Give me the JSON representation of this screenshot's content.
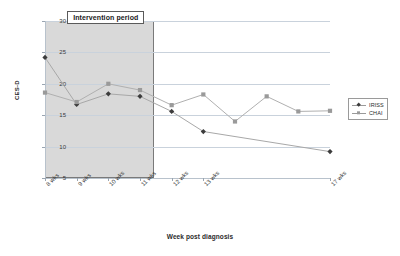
{
  "chart_data": {
    "type": "line",
    "title": "",
    "xlabel": "Week post diagnosis",
    "ylabel": "CES-D",
    "ylim": [
      5,
      30
    ],
    "yticks": [
      5,
      10,
      15,
      20,
      25,
      30
    ],
    "grid": true,
    "legend_position": "right",
    "categories": [
      "8 wks",
      "9 wks",
      "10 wks",
      "11 wks",
      "12 wks",
      "13 wks",
      "17 wks"
    ],
    "x_positions": [
      0,
      1,
      2,
      3,
      4,
      5,
      9
    ],
    "xlim": [
      0,
      9
    ],
    "annotations": [
      {
        "text": "Intervention period",
        "type": "shaded-band",
        "x_start": 0,
        "x_end": 3.45
      }
    ],
    "series": [
      {
        "name": "IRISS",
        "marker": "diamond",
        "color": "#3c3c3c",
        "line_color": "#a8a8a8",
        "x": [
          0,
          1,
          2,
          3,
          4,
          5,
          9
        ],
        "values": [
          24.2,
          16.7,
          18.4,
          18.0,
          15.6,
          12.4,
          9.2
        ]
      },
      {
        "name": "CHAI",
        "marker": "square",
        "color": "#9a9a9a",
        "line_color": "#b0b0b0",
        "x": [
          0,
          1,
          2,
          3,
          4,
          5,
          6,
          7,
          8,
          9
        ],
        "values": [
          18.6,
          17.1,
          20.0,
          19.0,
          16.6,
          18.3,
          14.0,
          18.0,
          15.6,
          15.7
        ]
      }
    ]
  },
  "legend": {
    "items": [
      {
        "label": "IRISS"
      },
      {
        "label": "CHAI"
      }
    ]
  },
  "axes": {
    "y_title": "CES-D",
    "x_title": "Week post diagnosis",
    "y_tick_labels": [
      "30",
      "25",
      "20",
      "15",
      "10",
      "5"
    ],
    "x_tick_labels": [
      "8 wks",
      "9 wks",
      "10 wks",
      "11 wks",
      "12 wks",
      "13 wks",
      "17 wks"
    ]
  },
  "annotation": {
    "intervention_label": "Intervention period"
  }
}
